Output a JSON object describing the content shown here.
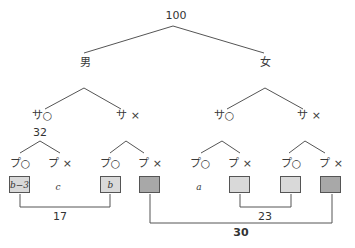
{
  "root": "100",
  "gender": {
    "male": "男",
    "female": "女"
  },
  "sa": {
    "yes": "サ○",
    "no": "サ ×"
  },
  "pu": {
    "yes": "プ○",
    "no": "プ ×"
  },
  "counts": {
    "male_sa_yes": "32"
  },
  "cells": {
    "m_sy_py": "b−3",
    "m_sy_pn": "c",
    "m_sn_py": "b",
    "f_sy_py": "a"
  },
  "brackets": {
    "b1": "17",
    "b2": "23",
    "b3": "30"
  },
  "colors": {
    "light_box": "#d9d9d9",
    "dark_box": "#a8a8a8",
    "line": "#555555"
  }
}
